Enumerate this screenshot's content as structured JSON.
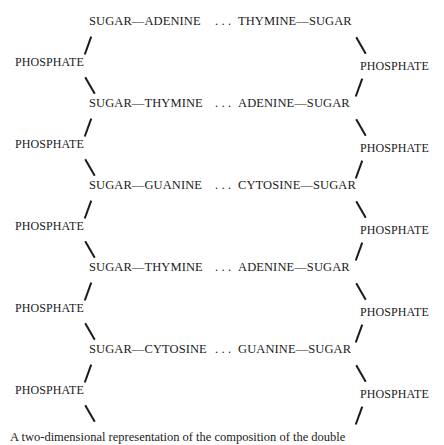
{
  "rows": [
    {
      "left": "SUGAR—ADENINE",
      "dots": "…",
      "right": "THYMINE—SUGAR"
    },
    {
      "left": "SUGAR—THYMINE",
      "dots": "…",
      "right": "ADENINE—SUGAR"
    },
    {
      "left": "SUGAR—GUANINE",
      "dots": "…",
      "right": "CYTOSINE—SUGAR"
    },
    {
      "left": "SUGAR—THYMINE",
      "dots": "…",
      "right": "ADENINE—SUGAR"
    },
    {
      "left": "SUGAR—CYTOSINE",
      "dots": "…",
      "right": "GUANINE—SUGAR"
    }
  ],
  "phosphate": "PHOSPHATE",
  "caption": "A two-dimensional representation of the composition of the double"
}
